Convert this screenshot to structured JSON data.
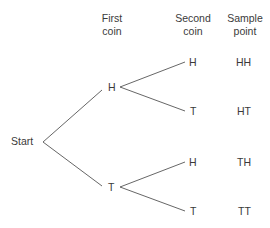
{
  "headers": {
    "first_coin": [
      "First",
      "coin"
    ],
    "second_coin": [
      "Second",
      "coin"
    ],
    "sample_point": [
      "Sample",
      "point"
    ]
  },
  "root": "Start",
  "first_level": [
    "H",
    "T"
  ],
  "second_level": [
    "H",
    "T",
    "H",
    "T"
  ],
  "sample_points": [
    "HH",
    "HT",
    "TH",
    "TT"
  ],
  "line_color": "#555555"
}
